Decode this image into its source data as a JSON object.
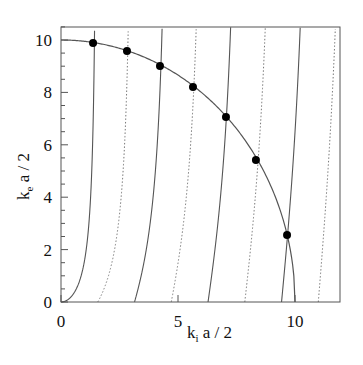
{
  "chart_data": {
    "type": "line",
    "title": "",
    "xlabel": "k_i a / 2",
    "ylabel": "k_e a / 2",
    "xlim": [
      0,
      11.9
    ],
    "ylim": [
      0,
      10.5
    ],
    "x_ticks": [
      0,
      5,
      10
    ],
    "x_tick_labels": [
      "0",
      "5",
      "10"
    ],
    "y_ticks": [
      0,
      2,
      4,
      6,
      8,
      10
    ],
    "y_tick_labels": [
      "0",
      "2",
      "4",
      "6",
      "8",
      "10"
    ],
    "y_minor_step": 0.5,
    "grid": false,
    "legend": null,
    "series": [
      {
        "name": "circle",
        "style": "solid",
        "formula": "k_e = sqrt(R^2 - k_i^2)",
        "R": 10
      },
      {
        "name": "even (k_e = k_i tan k_i)",
        "style": "solid",
        "branch_starts": [
          0,
          3.1416,
          6.2832,
          9.4248
        ]
      },
      {
        "name": "odd (k_e = -k_i cot k_i)",
        "style": "dotted",
        "branch_starts": [
          1.5708,
          4.7124,
          7.854,
          10.9956
        ]
      }
    ],
    "intersections": [
      {
        "x": 1.37,
        "y": 9.89
      },
      {
        "x": 2.82,
        "y": 9.58
      },
      {
        "x": 4.23,
        "y": 9.01
      },
      {
        "x": 5.64,
        "y": 8.21
      },
      {
        "x": 7.05,
        "y": 7.06
      },
      {
        "x": 8.33,
        "y": 5.42
      },
      {
        "x": 9.66,
        "y": 2.56
      }
    ]
  }
}
